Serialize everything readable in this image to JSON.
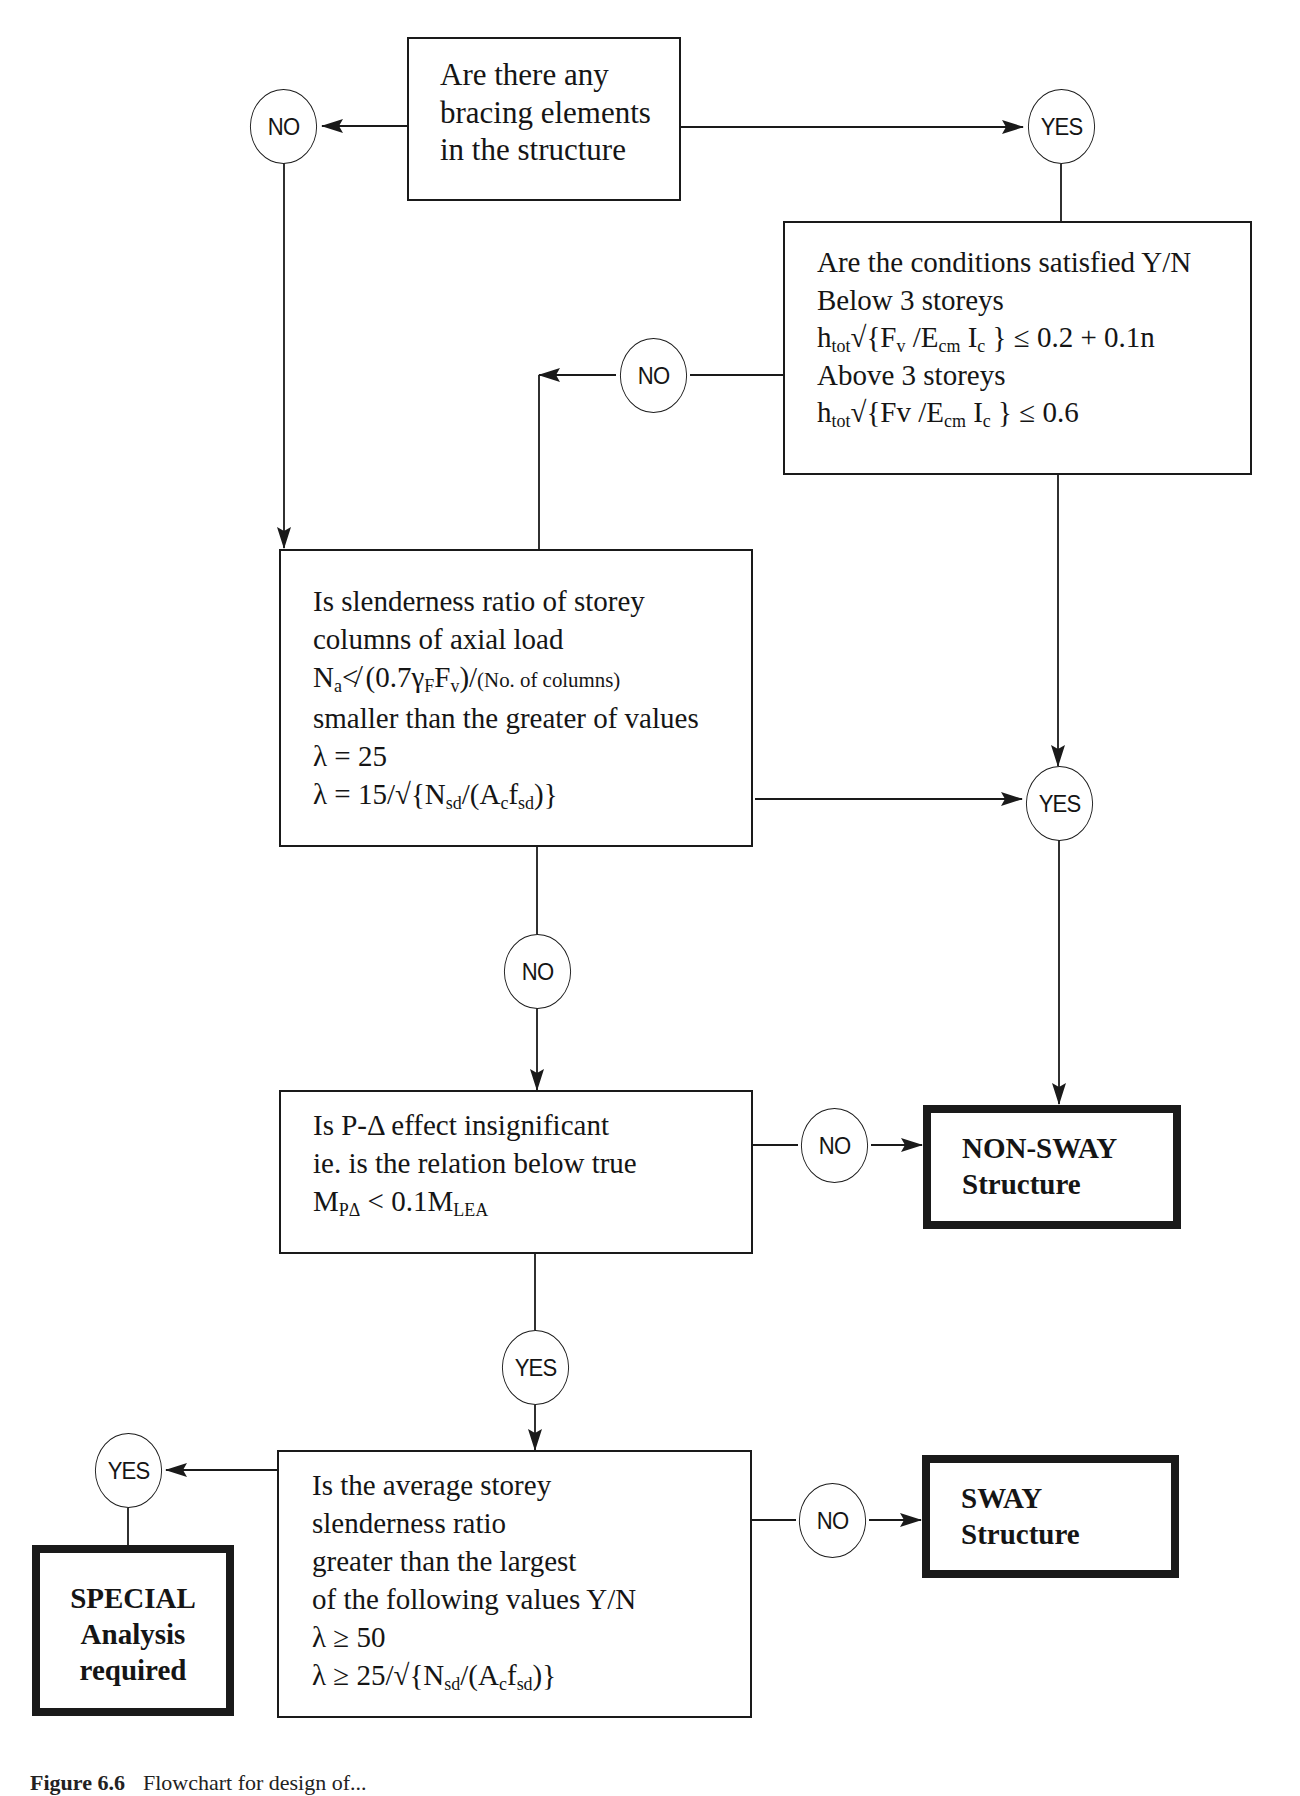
{
  "figure": {
    "caption_label": "Figure 6.6",
    "caption_text": "Flowchart for design of..."
  },
  "decisions": {
    "bracing": {
      "lines": [
        "Are there any",
        "bracing elements",
        "in the structure"
      ]
    },
    "conditions": {
      "line1": "Are the conditions satisfied Y/N",
      "line2": "Below 3 storeys",
      "line3_parts": [
        "h",
        "tot",
        "√{F",
        "v",
        " /E",
        "cm",
        " I",
        "c",
        " } ≤ 0.2 + 0.1n"
      ],
      "line4": "Above 3 storeys",
      "line5_parts": [
        "h",
        "tot",
        "√{Fv /E",
        "cm",
        " I",
        "c",
        " } ≤ 0.6"
      ]
    },
    "slenderness": {
      "line1": "Is slenderness ratio of storey",
      "line2": "columns of axial load",
      "line3_parts": [
        "N",
        "a",
        "≮ (0.7γ",
        "F",
        "F",
        "v",
        ")/",
        "(No. of columns)"
      ],
      "line4": "smaller than the greater of values",
      "line5": "λ = 25",
      "line6_parts": [
        "λ = 15/√{N",
        "sd",
        "/(A",
        "c",
        "f",
        "sd",
        ")}"
      ]
    },
    "p_delta": {
      "line1": "Is P-Δ effect insignificant",
      "line2": "ie. is the relation below true",
      "line3_parts": [
        "M",
        "PΔ",
        " < 0.1M",
        "LEA"
      ]
    },
    "average_slenderness": {
      "line1": "Is the average storey",
      "line2": "slenderness ratio",
      "line3": "greater than the largest",
      "line4": "of the following values Y/N",
      "line5": "λ ≥ 50",
      "line6_parts": [
        "λ ≥ 25/√{N",
        "sd",
        "/(A",
        "c",
        "f",
        "sd",
        ")}"
      ]
    }
  },
  "terminals": {
    "non_sway": {
      "line1": "NON-SWAY",
      "line2": "Structure"
    },
    "sway": {
      "line1": "SWAY",
      "line2": "Structure"
    },
    "special": {
      "line1": "SPECIAL",
      "line2": "Analysis",
      "line3": "required"
    }
  },
  "connectors": {
    "bracing_no": "NO",
    "bracing_yes": "YES",
    "conditions_no": "NO",
    "conditions_slenderness_yes": "YES",
    "slenderness_no": "NO",
    "p_delta_no": "NO",
    "p_delta_yes": "YES",
    "average_yes": "YES",
    "average_no": "NO"
  },
  "colors": {
    "ink": "#1a1a1a",
    "background": "#ffffff"
  }
}
